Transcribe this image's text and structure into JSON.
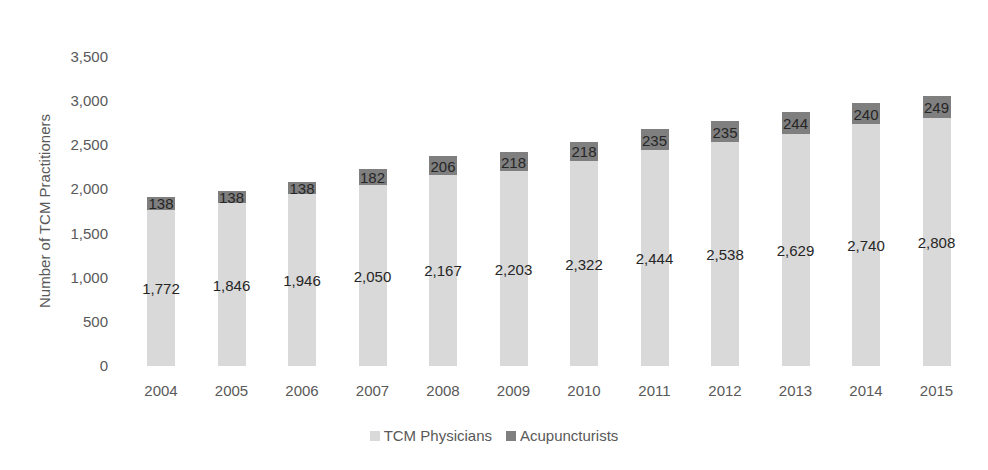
{
  "chart_data": {
    "type": "bar",
    "stacked": true,
    "title": "",
    "xlabel": "",
    "ylabel": "Number of TCM Practitioners",
    "ylim": [
      0,
      3500
    ],
    "yticks": [
      0,
      500,
      1000,
      1500,
      2000,
      2500,
      3000,
      3500
    ],
    "ytick_labels": [
      "0",
      "500",
      "1,000",
      "1,500",
      "2,000",
      "2,500",
      "3,000",
      "3,500"
    ],
    "grid": true,
    "legend_position": "bottom",
    "categories": [
      "2004",
      "2005",
      "2006",
      "2007",
      "2008",
      "2009",
      "2010",
      "2011",
      "2012",
      "2013",
      "2014",
      "2015"
    ],
    "series": [
      {
        "name": "TCM Physicians",
        "color": "#d9d9d9",
        "values": [
          1772,
          1846,
          1946,
          2050,
          2167,
          2203,
          2322,
          2444,
          2538,
          2629,
          2740,
          2808
        ],
        "labels": [
          "1,772",
          "1,846",
          "1,946",
          "2,050",
          "2,167",
          "2,203",
          "2,322",
          "2,444",
          "2,538",
          "2,629",
          "2,740",
          "2,808"
        ]
      },
      {
        "name": "Acupuncturists",
        "color": "#7f7f7f",
        "values": [
          138,
          138,
          138,
          182,
          206,
          218,
          218,
          235,
          235,
          244,
          240,
          249
        ],
        "labels": [
          "138",
          "138",
          "138",
          "182",
          "206",
          "218",
          "218",
          "235",
          "235",
          "244",
          "240",
          "249"
        ]
      }
    ]
  }
}
